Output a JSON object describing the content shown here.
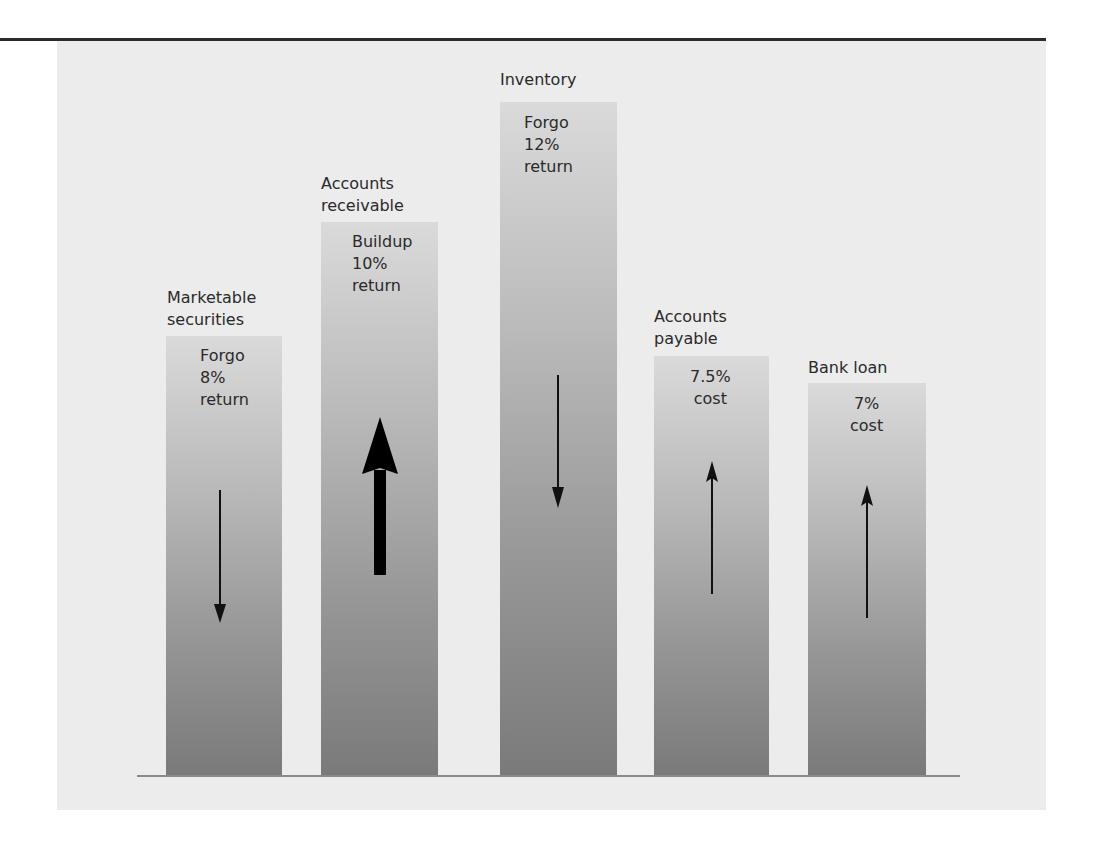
{
  "figure": {
    "bars": [
      {
        "label": "Marketable\nsecurities",
        "inner": "Forgo\n8%\nreturn",
        "direction": "down",
        "emphasis": "normal"
      },
      {
        "label": "Accounts\nreceivable",
        "inner": "Buildup\n10%\nreturn",
        "direction": "up",
        "emphasis": "bold"
      },
      {
        "label": "Inventory",
        "inner": "Forgo\n12%\nreturn",
        "direction": "down",
        "emphasis": "normal"
      },
      {
        "label": "Accounts\npayable",
        "inner": "7.5%\ncost",
        "direction": "up",
        "emphasis": "normal"
      },
      {
        "label": "Bank loan",
        "inner": "7%\ncost",
        "direction": "up",
        "emphasis": "normal"
      }
    ],
    "colors": {
      "panel": "#ececec",
      "bar_top": "#dadada",
      "bar_bottom": "#7a7a7a",
      "arrow": "#111111",
      "rule": "#2b2b2b"
    }
  }
}
